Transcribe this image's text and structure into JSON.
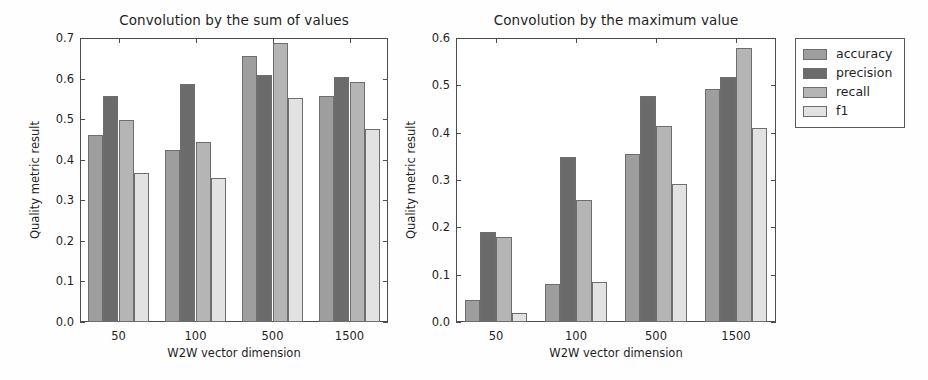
{
  "figure": {
    "width": 928,
    "height": 380,
    "background": "#fefefe"
  },
  "series_colors": {
    "accuracy": "#9e9e9e",
    "precision": "#6b6b6b",
    "recall": "#b5b5b5",
    "f1": "#e2e2e2"
  },
  "legend": {
    "position": "right",
    "items": [
      {
        "label": "accuracy",
        "color": "#9e9e9e"
      },
      {
        "label": "precision",
        "color": "#6b6b6b"
      },
      {
        "label": "recall",
        "color": "#b5b5b5"
      },
      {
        "label": "f1",
        "color": "#e2e2e2"
      }
    ]
  },
  "chart_data": [
    {
      "type": "bar",
      "title": "Convolution by the sum of values",
      "xlabel": "W2W vector dimension",
      "ylabel": "Quality metric result",
      "categories": [
        "50",
        "100",
        "500",
        "1500"
      ],
      "ylim": [
        0.0,
        0.7
      ],
      "yticks": [
        "0.0",
        "0.1",
        "0.2",
        "0.3",
        "0.4",
        "0.5",
        "0.6",
        "0.7"
      ],
      "ytick_values": [
        0.0,
        0.1,
        0.2,
        0.3,
        0.4,
        0.5,
        0.6,
        0.7
      ],
      "grid": false,
      "series": [
        {
          "name": "accuracy",
          "values": [
            0.461,
            0.425,
            0.655,
            0.557
          ]
        },
        {
          "name": "precision",
          "values": [
            0.556,
            0.587,
            0.609,
            0.604
          ]
        },
        {
          "name": "recall",
          "values": [
            0.499,
            0.443,
            0.687,
            0.591
          ]
        },
        {
          "name": "f1",
          "values": [
            0.368,
            0.356,
            0.552,
            0.476
          ]
        }
      ]
    },
    {
      "type": "bar",
      "title": "Convolution by the maximum value",
      "xlabel": "W2W vector dimension",
      "ylabel": "Quality metric result",
      "categories": [
        "50",
        "100",
        "500",
        "1500"
      ],
      "ylim": [
        0.0,
        0.6
      ],
      "yticks": [
        "0.0",
        "0.1",
        "0.2",
        "0.3",
        "0.4",
        "0.5",
        "0.6"
      ],
      "ytick_values": [
        0.0,
        0.1,
        0.2,
        0.3,
        0.4,
        0.5,
        0.6
      ],
      "grid": false,
      "series": [
        {
          "name": "accuracy",
          "values": [
            0.046,
            0.08,
            0.355,
            0.493
          ]
        },
        {
          "name": "precision",
          "values": [
            0.191,
            0.349,
            0.478,
            0.518
          ]
        },
        {
          "name": "recall",
          "values": [
            0.18,
            0.257,
            0.415,
            0.578
          ]
        },
        {
          "name": "f1",
          "values": [
            0.018,
            0.085,
            0.291,
            0.409
          ]
        }
      ]
    }
  ]
}
